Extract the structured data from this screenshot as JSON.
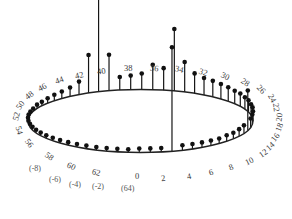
{
  "figure": {
    "type": "circular-stem-plot",
    "colors": {
      "stem": "#151515",
      "marker": "#111111",
      "ellipse": "#222222",
      "label": "#3a3a3a",
      "background": "#ffffff"
    },
    "ellipse": {
      "cx": 140.5,
      "cy": 121.0,
      "rx": 112.5,
      "ry": 31.5,
      "stroke_width": 1.4
    },
    "marker_radius": 2.3,
    "stem_width": 1.2
  },
  "chart_data": {
    "type": "scatter",
    "title": "",
    "xlabel": "",
    "ylabel": "",
    "n_points": 64,
    "index_labels": [
      "0",
      "2",
      "4",
      "6",
      "8",
      "10",
      "12",
      "14",
      "16",
      "18",
      "20",
      "22",
      "24",
      "26",
      "28",
      "30",
      "32",
      "34",
      "36",
      "38",
      "40",
      "42",
      "44",
      "46",
      "48",
      "50",
      "52",
      "54",
      "56",
      "58",
      "60",
      "62"
    ],
    "negative_labels": [
      "(-8)",
      "(-6)",
      "(-4)",
      "(-2)",
      "(64)"
    ],
    "angle_of_index_0_deg": 95,
    "angle_direction": "counterclockwise-in-plot",
    "heights": [
      14,
      13,
      36,
      118,
      38,
      13,
      9,
      7,
      6,
      5,
      4,
      4,
      3,
      3,
      3,
      3,
      3,
      3,
      3,
      3,
      3,
      3,
      3,
      3,
      3,
      3,
      3,
      3,
      3,
      3,
      3,
      4,
      4,
      4,
      104,
      5,
      5,
      5,
      5,
      5,
      6,
      6,
      7,
      8,
      40,
      9,
      10,
      10,
      11,
      11,
      12,
      12,
      13,
      13,
      14,
      15,
      16,
      17,
      20,
      30,
      62,
      22,
      25,
      16
    ],
    "height_unit": "pixels above ellipse",
    "grid": false,
    "legend": null
  },
  "labels": [
    {
      "text": "0",
      "x": 142,
      "y": 177,
      "rot": 0
    },
    {
      "text": "2",
      "x": 168,
      "y": 179,
      "rot": -8
    },
    {
      "text": "4",
      "x": 194,
      "y": 177,
      "rot": -12
    },
    {
      "text": "6",
      "x": 216,
      "y": 173,
      "rot": -16
    },
    {
      "text": "8",
      "x": 236,
      "y": 168,
      "rot": -20
    },
    {
      "text": "10",
      "x": 252,
      "y": 162,
      "rot": -26
    },
    {
      "text": "12",
      "x": 266,
      "y": 154,
      "rot": -34
    },
    {
      "text": "14",
      "x": 273,
      "y": 147,
      "rot": -42
    },
    {
      "text": "16",
      "x": 278,
      "y": 138,
      "rot": -52
    },
    {
      "text": "18",
      "x": 282,
      "y": 128,
      "rot": -68
    },
    {
      "text": "20",
      "x": 282,
      "y": 118,
      "rot": -84
    },
    {
      "text": "22",
      "x": 279,
      "y": 108,
      "rot": 82
    },
    {
      "text": "24",
      "x": 275,
      "y": 99,
      "rot": 62
    },
    {
      "text": "26",
      "x": 264,
      "y": 90,
      "rot": 46
    },
    {
      "text": "28",
      "x": 248,
      "y": 83,
      "rot": 34
    },
    {
      "text": "30",
      "x": 228,
      "y": 77,
      "rot": 26
    },
    {
      "text": "32",
      "x": 206,
      "y": 73,
      "rot": 18
    },
    {
      "text": "34",
      "x": 182,
      "y": 70,
      "rot": 12
    },
    {
      "text": "36",
      "x": 157,
      "y": 69,
      "rot": 6
    },
    {
      "text": "38",
      "x": 131,
      "y": 69,
      "rot": 0
    },
    {
      "text": "40",
      "x": 104,
      "y": 72,
      "rot": -8
    },
    {
      "text": "42",
      "x": 82,
      "y": 76,
      "rot": -14
    },
    {
      "text": "44",
      "x": 62,
      "y": 81,
      "rot": -20
    },
    {
      "text": "46",
      "x": 45,
      "y": 88,
      "rot": -28
    },
    {
      "text": "48",
      "x": 32,
      "y": 96,
      "rot": -38
    },
    {
      "text": "50",
      "x": 23,
      "y": 106,
      "rot": -54
    },
    {
      "text": "52",
      "x": 19,
      "y": 117,
      "rot": -76
    },
    {
      "text": "54",
      "x": 22,
      "y": 131,
      "rot": 74
    },
    {
      "text": "56",
      "x": 32,
      "y": 144,
      "rot": 52
    },
    {
      "text": "58",
      "x": 52,
      "y": 157,
      "rot": 36
    },
    {
      "text": "60",
      "x": 74,
      "y": 167,
      "rot": 24
    },
    {
      "text": "62",
      "x": 99,
      "y": 173,
      "rot": 14
    }
  ],
  "neg_labels": [
    {
      "text": "(-8)",
      "x": 38,
      "y": 170
    },
    {
      "text": "(-6)",
      "x": 58,
      "y": 181
    },
    {
      "text": "(-4)",
      "x": 78,
      "y": 186
    },
    {
      "text": "(-2)",
      "x": 101,
      "y": 188
    },
    {
      "text": "(64)",
      "x": 130,
      "y": 190
    }
  ]
}
